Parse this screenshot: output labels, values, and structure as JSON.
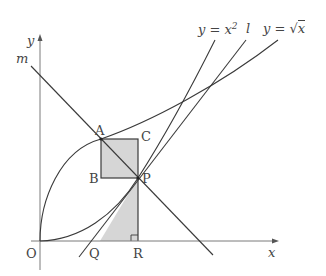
{
  "diagram": {
    "axes": {
      "x_label": "x",
      "y_label": "y",
      "origin_label": "O"
    },
    "curves": [
      {
        "name": "parabola",
        "label": "y = x",
        "exponent": "2"
      },
      {
        "name": "sqrt-curve",
        "label_prefix": "y = ",
        "radicand": "x"
      }
    ],
    "lines": [
      {
        "name": "line-l",
        "label": "l"
      },
      {
        "name": "line-m",
        "label": "m"
      }
    ],
    "points": {
      "A": "A",
      "B": "B",
      "C": "C",
      "P": "P",
      "Q": "Q",
      "R": "R"
    },
    "shaded_regions": [
      "rectangle ABPC",
      "triangle QRP"
    ],
    "right_angle_mark": "R",
    "colors": {
      "stroke": "#3a3a3a",
      "axis": "#7a7a7a",
      "shade": "#d6d6d6"
    }
  }
}
